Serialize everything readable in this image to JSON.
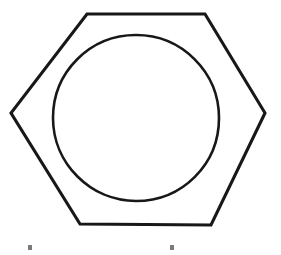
{
  "figure": {
    "background_color": "#ffffff",
    "stroke_color": "#181818",
    "tick_color": "#7a7a7a",
    "width": 281,
    "height": 255,
    "caption": ""
  },
  "chart_data": {
    "type": "diagram",
    "shapes": [
      {
        "name": "hexagon-outline",
        "type": "polygon",
        "stroke_width": 3.1,
        "points": [
          [
            87,
            14
          ],
          [
            205,
            14
          ],
          [
            265,
            113
          ],
          [
            211,
            225
          ],
          [
            80,
            224
          ],
          [
            11,
            113
          ]
        ]
      },
      {
        "name": "bore-circle",
        "type": "circle",
        "stroke_width": 2.6,
        "center": [
          136,
          118
        ],
        "radius_x": 83,
        "radius_y": 83,
        "bounds": {
          "left": 53,
          "top": 35,
          "right": 220,
          "bottom": 202
        }
      },
      {
        "name": "tick-mark-left",
        "type": "rect",
        "x": 28,
        "y": 245,
        "width": 4,
        "height": 5
      },
      {
        "name": "tick-mark-right",
        "type": "rect",
        "x": 170,
        "y": 245,
        "width": 4,
        "height": 5
      }
    ],
    "axis_labels": [],
    "legend": [],
    "annotations": []
  }
}
